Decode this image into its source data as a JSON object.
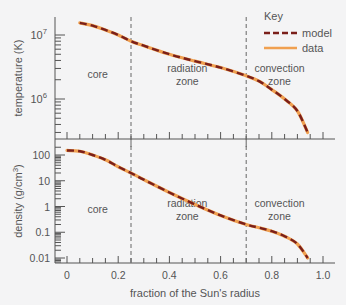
{
  "chart_data": [
    {
      "type": "line",
      "title": "",
      "xlabel": "fraction of the Sun's radius",
      "ylabel": "temperature (K)",
      "yscale": "log",
      "ylim": [
        240000,
        20000000
      ],
      "xlim": [
        -0.05,
        1.05
      ],
      "ytick_labels": [
        "10^7",
        "10^6"
      ],
      "ytick_values": [
        10000000,
        1000000
      ],
      "zones": [
        {
          "label": [
            "core"
          ],
          "x": 0.12
        },
        {
          "label": [
            "radiation",
            "zone"
          ],
          "x": 0.47
        },
        {
          "label": [
            "convection",
            "zone"
          ],
          "x": 0.83
        }
      ],
      "zone_boundaries": [
        0.25,
        0.7
      ],
      "x": [
        0.05,
        0.1,
        0.15,
        0.2,
        0.25,
        0.3,
        0.4,
        0.5,
        0.6,
        0.7,
        0.75,
        0.8,
        0.85,
        0.9,
        0.94
      ],
      "series": [
        {
          "name": "model",
          "values": [
            15500000,
            14000000,
            12000000,
            10000000,
            8000000,
            6800000,
            5000000,
            3900000,
            3100000,
            2300000,
            1900000,
            1400000,
            1000000,
            650000,
            300000
          ]
        },
        {
          "name": "data",
          "values": [
            15500000,
            14000000,
            12000000,
            10000000,
            8000000,
            6800000,
            5000000,
            3900000,
            3100000,
            2300000,
            1900000,
            1400000,
            1000000,
            650000,
            300000
          ]
        }
      ],
      "legend": {
        "title": "Key",
        "entries": [
          "model",
          "data"
        ],
        "position": "top-right"
      },
      "grid": false
    },
    {
      "type": "line",
      "title": "",
      "xlabel": "fraction of the Sun's radius",
      "ylabel": "density (g/cm^3)",
      "yscale": "log",
      "ylim": [
        0.007,
        250
      ],
      "xlim": [
        -0.05,
        1.05
      ],
      "ytick_labels": [
        "100",
        "10",
        "1",
        "0.1",
        "0.01"
      ],
      "ytick_values": [
        100,
        10,
        1,
        0.1,
        0.01
      ],
      "xtick_labels": [
        "0",
        "0.2",
        "0.4",
        "0.6",
        "0.8",
        "1.0"
      ],
      "xtick_values": [
        0,
        0.2,
        0.4,
        0.6,
        0.8,
        1.0
      ],
      "zones": [
        {
          "label": [
            "core"
          ],
          "x": 0.12
        },
        {
          "label": [
            "radiation",
            "zone"
          ],
          "x": 0.47
        },
        {
          "label": [
            "convection",
            "zone"
          ],
          "x": 0.83
        }
      ],
      "zone_boundaries": [
        0.25,
        0.7
      ],
      "x": [
        0.0,
        0.05,
        0.1,
        0.15,
        0.2,
        0.25,
        0.3,
        0.4,
        0.5,
        0.6,
        0.7,
        0.75,
        0.8,
        0.85,
        0.9,
        0.94
      ],
      "series": [
        {
          "name": "model",
          "values": [
            150,
            140,
            100,
            65,
            35,
            20,
            11,
            3.5,
            1.2,
            0.45,
            0.2,
            0.15,
            0.11,
            0.07,
            0.035,
            0.01
          ]
        },
        {
          "name": "data",
          "values": [
            150,
            140,
            100,
            65,
            35,
            20,
            11,
            3.5,
            1.2,
            0.45,
            0.2,
            0.15,
            0.11,
            0.07,
            0.035,
            0.01
          ]
        }
      ],
      "grid": false
    }
  ],
  "colors": {
    "model": "#7a1f1a",
    "data": "#f0a050",
    "axis": "#555555",
    "background": "#f4f4f5"
  }
}
